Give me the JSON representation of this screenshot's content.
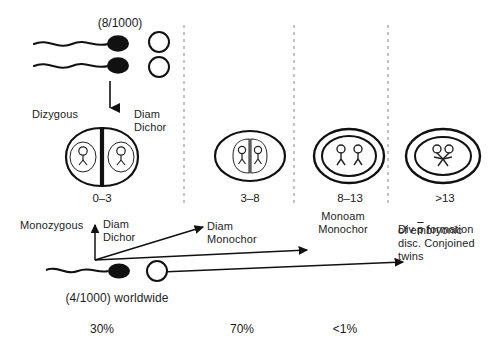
{
  "figure": {
    "header_incidence": "(8/1000)",
    "bottom_incidence": "(4/1000) worldwide",
    "dizygous_label": "Dizygous",
    "monozygous_label": "Monozygous"
  },
  "columns": [
    {
      "id": "col-0-3",
      "days": "0–3",
      "type_line1": "Diam",
      "type_line2": "Dichor",
      "percent": "30%",
      "embryo": "dizygotic-two-sacs"
    },
    {
      "id": "col-3-8",
      "days": "3–8",
      "type_line1": "Diam",
      "type_line2": "Monochor",
      "percent": "70%",
      "embryo": "diamniotic-monochorionic"
    },
    {
      "id": "col-8-13",
      "days": "8–13",
      "type_line1": "Monoam",
      "type_line2": "Monochor",
      "percent": "<1%",
      "embryo": "monoamniotic-monochorionic"
    },
    {
      "id": "col-gt-13",
      "days": ">13",
      "type_line1": "Div p̄ formation",
      "type_line2": "of embryonic",
      "type_line3": "disc. Conjoined",
      "type_line4": "twins",
      "percent": "",
      "embryo": "conjoined-twins"
    }
  ],
  "top_row": {
    "sperm_count": 2,
    "ovum_count": 2,
    "dizygous_type_line1": "Diam",
    "dizygous_type_line2": "Dichor"
  },
  "bottom_row": {
    "sperm_count": 1,
    "ovum_count": 1
  },
  "colors": {
    "ink": "#1a1a1a",
    "divider": "#9a9a9a",
    "background": "#ffffff"
  }
}
